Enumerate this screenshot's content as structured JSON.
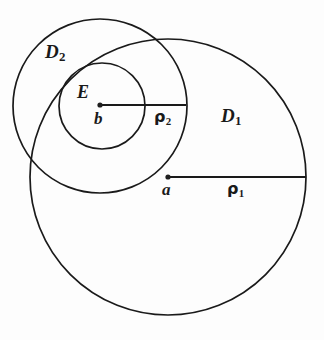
{
  "figure": {
    "background_color": "#fdfdfd",
    "stroke_color": "#1a1a1a",
    "labels": {
      "disk_large": "D",
      "disk_large_sub": "1",
      "disk_medium": "D",
      "disk_medium_sub": "2",
      "set_e": "E",
      "center_large": "a",
      "center_medium": "b",
      "radius_large": "ρ",
      "radius_large_sub": "1",
      "radius_medium": "ρ",
      "radius_medium_sub": "2"
    },
    "geometry": {
      "circle_d1": {
        "cx": 168,
        "cy": 177,
        "r": 138
      },
      "circle_d2": {
        "cx": 100,
        "cy": 106,
        "r": 87
      },
      "circle_e": {
        "cx": 102,
        "cy": 106,
        "r": 43
      },
      "radius_line_1": {
        "x1": 168,
        "y1": 177,
        "x2": 306,
        "y2": 177
      },
      "radius_line_2": {
        "x1": 100,
        "y1": 105,
        "x2": 186,
        "y2": 105
      },
      "center_dot_a": {
        "cx": 168,
        "cy": 177,
        "r": 2.6
      },
      "center_dot_b": {
        "cx": 100,
        "cy": 105,
        "r": 2.6
      }
    }
  }
}
